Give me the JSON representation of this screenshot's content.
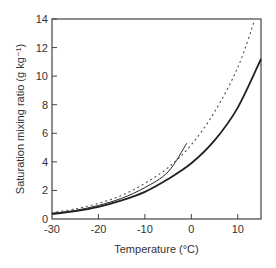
{
  "chart_data": {
    "type": "line",
    "title": "",
    "xlabel": "Temperature (°C)",
    "ylabel": "Saturation mixing ratio (g kg⁻¹)",
    "xlim": [
      -30,
      15
    ],
    "ylim": [
      0,
      14
    ],
    "x_ticks": [
      -30,
      -20,
      -10,
      0,
      10
    ],
    "y_ticks": [
      0,
      2,
      4,
      6,
      8,
      10,
      12,
      14
    ],
    "grid": false,
    "legend": null,
    "series": [
      {
        "name": "solid-thick",
        "style": "solid",
        "width": 1.8,
        "x": [
          -30,
          -25,
          -20,
          -15,
          -10,
          -5,
          0,
          5,
          10,
          15
        ],
        "y": [
          0.35,
          0.55,
          0.85,
          1.3,
          1.9,
          2.8,
          3.9,
          5.5,
          7.8,
          11.2
        ]
      },
      {
        "name": "solid-thin",
        "style": "solid",
        "width": 1.0,
        "x": [
          -30,
          -25,
          -20,
          -15,
          -10,
          -5,
          -1
        ],
        "y": [
          0.4,
          0.6,
          0.95,
          1.45,
          2.2,
          3.3,
          5.3
        ]
      },
      {
        "name": "dotted",
        "style": "dotted",
        "width": 1.2,
        "x": [
          -30,
          -25,
          -20,
          -15,
          -10,
          -5,
          0,
          5,
          10,
          13.5
        ],
        "y": [
          0.45,
          0.7,
          1.1,
          1.65,
          2.5,
          3.6,
          5.2,
          7.5,
          10.6,
          13.8
        ]
      }
    ]
  }
}
